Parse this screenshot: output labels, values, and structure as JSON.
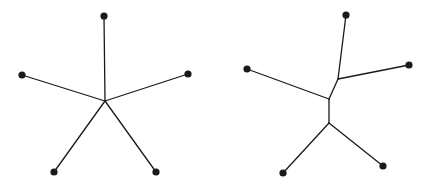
{
  "diagrams": [
    {
      "name": "star-tree",
      "leaves": [
        {
          "x": 104,
          "y": 16
        },
        {
          "x": 22,
          "y": 75
        },
        {
          "x": 188,
          "y": 74
        },
        {
          "x": 54,
          "y": 172
        },
        {
          "x": 156,
          "y": 172
        }
      ],
      "internal_nodes": [
        {
          "x": 105,
          "y": 101
        }
      ],
      "edges": [
        [
          105,
          101,
          104,
          16
        ],
        [
          105,
          101,
          22,
          75
        ],
        [
          105,
          101,
          188,
          74
        ],
        [
          105,
          101,
          54,
          172
        ],
        [
          105,
          101,
          156,
          172
        ]
      ]
    },
    {
      "name": "resolved-tree",
      "leaves": [
        {
          "x": 346,
          "y": 15
        },
        {
          "x": 409,
          "y": 65
        },
        {
          "x": 247,
          "y": 69
        },
        {
          "x": 283,
          "y": 173
        },
        {
          "x": 383,
          "y": 166
        }
      ],
      "internal_nodes": [
        {
          "x": 338,
          "y": 79
        },
        {
          "x": 329,
          "y": 99
        },
        {
          "x": 329,
          "y": 123
        }
      ],
      "edges": [
        [
          338,
          79,
          346,
          15
        ],
        [
          338,
          79,
          409,
          65
        ],
        [
          338,
          79,
          329,
          99
        ],
        [
          329,
          99,
          247,
          69
        ],
        [
          329,
          99,
          329,
          123
        ],
        [
          329,
          123,
          283,
          173
        ],
        [
          329,
          123,
          383,
          166
        ]
      ]
    }
  ],
  "style": {
    "line_color": "#1a1a1a",
    "node_color": "#1a1a1a",
    "background": "#ffffff",
    "node_radius": 3.6
  }
}
